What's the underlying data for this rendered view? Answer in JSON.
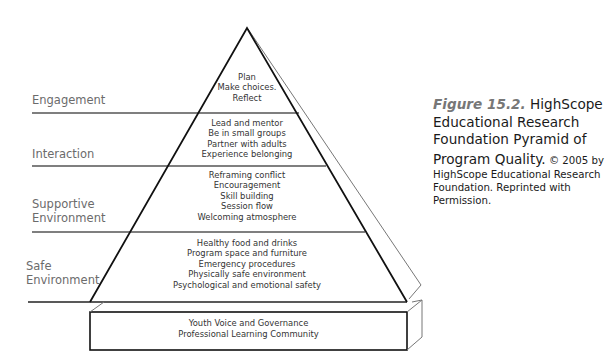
{
  "figure": {
    "colors": {
      "line": "#1a1a1a",
      "back_edge": "#777777",
      "label_text": "#6b6b6b",
      "figure_number": "#777777"
    },
    "tiers": [
      {
        "label": "Engagement",
        "items": [
          "Plan",
          "Make choices.",
          "Reflect"
        ]
      },
      {
        "label": "Interaction",
        "items": [
          "Lead and mentor",
          "Be in small groups",
          "Partner with adults",
          "Experience belonging"
        ]
      },
      {
        "label": "Supportive\nEnvironment",
        "items": [
          "Reframing conflict",
          "Encouragement",
          "Skill building",
          "Session flow",
          "Welcoming atmosphere"
        ]
      },
      {
        "label": "Safe\nEnvironment",
        "items": [
          "Healthy food and drinks",
          "Program space and furniture",
          "Emergency procedures",
          "Physically safe environment",
          "Psychological and emotional safety"
        ]
      }
    ],
    "base": {
      "items": [
        "Youth Voice and Governance",
        "Professional Learning Community"
      ]
    },
    "caption": {
      "figure_number": "Figure 15.2.",
      "title_part1": " HighScope",
      "title_part2": "Educational Research",
      "title_part3": "Foundation Pyramid of",
      "title_part4": "Program Quality.",
      "credit_inline": " © 2005 by",
      "credit_line2": "HighScope Educational Research",
      "credit_line3": "Foundation. Reprinted with",
      "credit_line4": "Permission."
    }
  }
}
